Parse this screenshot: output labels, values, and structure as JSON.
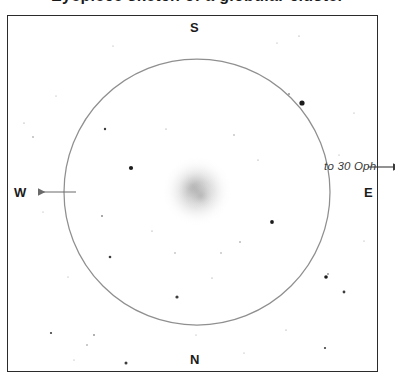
{
  "chart_data": {
    "type": "scatter",
    "title": "Eyepiece sketch of a globular cluster",
    "subtitle": "",
    "xlabel": "",
    "ylabel": "",
    "grid": false,
    "legend_position": "none",
    "field_of_view": {
      "shape": "circle",
      "center_x": 197,
      "center_y": 192,
      "radius": 133,
      "stroke_color": "#8f8f8f"
    },
    "orientation": {
      "top": "S",
      "bottom": "N",
      "left": "W",
      "right": "E"
    },
    "deep_sky_object": {
      "label": "",
      "kind": "globular-cluster",
      "center_x": 197,
      "center_y": 191,
      "radius": 34,
      "core_gray": "#b8b8b8",
      "halo_gray": "#e8e8e8"
    },
    "annotations": [
      {
        "text": "to 30 Oph",
        "x": 324,
        "y": 160,
        "style": "italic",
        "arrow": "right"
      }
    ],
    "arrows": [
      {
        "name": "west-arrow",
        "direction": "left",
        "x1": 76,
        "y1": 192,
        "x2": 38,
        "y2": 192
      },
      {
        "name": "east-arrow",
        "direction": "right",
        "x1": 368,
        "y1": 167,
        "x2": 393,
        "y2": 167
      }
    ],
    "stars": [
      {
        "x": 302,
        "y": 103,
        "r": 2.6
      },
      {
        "x": 131,
        "y": 168,
        "r": 2.1
      },
      {
        "x": 272,
        "y": 222,
        "r": 1.9
      },
      {
        "x": 326,
        "y": 277,
        "r": 1.8
      },
      {
        "x": 177,
        "y": 297,
        "r": 1.6
      },
      {
        "x": 110,
        "y": 257,
        "r": 1.3
      },
      {
        "x": 105,
        "y": 129,
        "r": 1.2
      },
      {
        "x": 289,
        "y": 94,
        "r": 0.9
      },
      {
        "x": 344,
        "y": 292,
        "r": 1.4
      },
      {
        "x": 102,
        "y": 216,
        "r": 1.0
      },
      {
        "x": 240,
        "y": 242,
        "r": 0.8
      },
      {
        "x": 221,
        "y": 253,
        "r": 0.7
      },
      {
        "x": 234,
        "y": 135,
        "r": 0.7
      },
      {
        "x": 166,
        "y": 129,
        "r": 0.6
      },
      {
        "x": 152,
        "y": 231,
        "r": 0.6
      },
      {
        "x": 258,
        "y": 160,
        "r": 0.6
      },
      {
        "x": 175,
        "y": 253,
        "r": 0.7
      },
      {
        "x": 212,
        "y": 278,
        "r": 0.6
      },
      {
        "x": 126,
        "y": 363,
        "r": 1.5
      },
      {
        "x": 51,
        "y": 333,
        "r": 1.1
      },
      {
        "x": 94,
        "y": 335,
        "r": 0.9
      },
      {
        "x": 87,
        "y": 345,
        "r": 0.8
      },
      {
        "x": 325,
        "y": 348,
        "r": 1.1
      },
      {
        "x": 328,
        "y": 274,
        "r": 0.9
      },
      {
        "x": 33,
        "y": 137,
        "r": 0.8
      },
      {
        "x": 24,
        "y": 123,
        "r": 0.6
      },
      {
        "x": 56,
        "y": 96,
        "r": 0.5
      },
      {
        "x": 113,
        "y": 46,
        "r": 0.5
      },
      {
        "x": 299,
        "y": 36,
        "r": 0.6
      },
      {
        "x": 277,
        "y": 43,
        "r": 0.5
      },
      {
        "x": 339,
        "y": 155,
        "r": 0.5
      },
      {
        "x": 354,
        "y": 113,
        "r": 0.5
      },
      {
        "x": 364,
        "y": 241,
        "r": 0.5
      },
      {
        "x": 286,
        "y": 330,
        "r": 0.6
      },
      {
        "x": 244,
        "y": 353,
        "r": 0.5
      },
      {
        "x": 196,
        "y": 335,
        "r": 0.5
      },
      {
        "x": 68,
        "y": 277,
        "r": 0.5
      },
      {
        "x": 43,
        "y": 212,
        "r": 0.5
      },
      {
        "x": 74,
        "y": 360,
        "r": 0.5
      }
    ]
  },
  "frame": {
    "border_color": "#2b2b2b",
    "background": "#ffffff"
  },
  "labels": {
    "title": "Eyepiece sketch of a globular cluster",
    "cardinal_south": "S",
    "cardinal_north": "N",
    "cardinal_west": "W",
    "cardinal_east": "E",
    "annotation": "to 30 Oph"
  }
}
